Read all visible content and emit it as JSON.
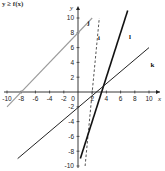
{
  "header": {
    "label": "y ≥ f(x)"
  },
  "chart_data": {
    "type": "line",
    "title": "",
    "xlabel": "x",
    "ylabel": "y",
    "xlim": [
      -10,
      10
    ],
    "ylim": [
      -10,
      10
    ],
    "grid": false,
    "x_ticks": [
      -10,
      -8,
      -6,
      -4,
      -2,
      0,
      2,
      4,
      6,
      8,
      10
    ],
    "y_ticks": [
      -10,
      -8,
      -6,
      -4,
      -2,
      2,
      4,
      6,
      8,
      10
    ],
    "x_tick_labels": [
      "-10",
      "-8",
      "-6",
      "-4",
      "-2",
      "0",
      "2",
      "4",
      "6",
      "8",
      "10"
    ],
    "y_tick_labels": [
      "-10",
      "-8",
      "-6",
      "-4",
      "-2",
      "2",
      "4",
      "6",
      "8",
      "10"
    ],
    "series": [
      {
        "name": "j",
        "style": "solid-gray",
        "color": "#9a9a9a",
        "x": [
          -10,
          2
        ],
        "y": [
          -2,
          10
        ],
        "equation": "y = x + 8"
      },
      {
        "name": "i",
        "style": "dashed",
        "color": "#555555",
        "x": [
          1,
          3
        ],
        "y": [
          -10,
          10
        ],
        "equation": "y = 10x - 20"
      },
      {
        "name": "l",
        "style": "solid-thick",
        "color": "#111111",
        "x": [
          0.33,
          7
        ],
        "y": [
          -9,
          11
        ],
        "equation": "y = 3x - 10"
      },
      {
        "name": "k",
        "style": "solid-thin",
        "color": "#222222",
        "x": [
          -8.5,
          10
        ],
        "y": [
          -9,
          6
        ],
        "equation": "y = 0.8x - 2.4"
      }
    ],
    "labels": [
      {
        "text": "j",
        "x": 1.3,
        "y": 9
      },
      {
        "text": "i",
        "x": 2.8,
        "y": 7
      },
      {
        "text": "l",
        "x": 7.2,
        "y": 7.2
      },
      {
        "text": "k",
        "x": 10.2,
        "y": 3.4
      }
    ]
  }
}
